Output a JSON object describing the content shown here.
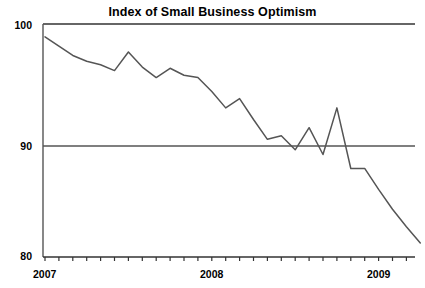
{
  "chart_data": {
    "type": "line",
    "title": "Index of Small Business Optimism",
    "xlabel": "",
    "ylabel": "",
    "ylim": [
      80,
      100
    ],
    "xlim": [
      "2007-01",
      "2009-04"
    ],
    "grid": false,
    "legend": "none",
    "y_ticks": [
      "100",
      "90",
      "80"
    ],
    "y_tick_values": [
      100,
      90,
      80
    ],
    "x_ticks": [
      "2007",
      "2008",
      "2009"
    ],
    "x_tick_values": [
      "2007-01",
      "2008-01",
      "2009-01"
    ],
    "minor_x_ticks": "monthly",
    "reference_lines": [
      {
        "axis": "y",
        "value": 90,
        "label": "90"
      },
      {
        "axis": "y",
        "value": 100,
        "label": "100"
      }
    ],
    "line_color": "#555555",
    "axis_color": "#333333",
    "x": [
      "2007-01",
      "2007-02",
      "2007-03",
      "2007-04",
      "2007-05",
      "2007-06",
      "2007-07",
      "2007-08",
      "2007-09",
      "2007-10",
      "2007-11",
      "2007-12",
      "2008-01",
      "2008-02",
      "2008-03",
      "2008-04",
      "2008-05",
      "2008-06",
      "2008-07",
      "2008-08",
      "2008-09",
      "2008-10",
      "2008-11",
      "2008-12",
      "2009-01",
      "2009-02",
      "2009-03",
      "2009-04"
    ],
    "categories": [
      "Jan 2007",
      "Feb 2007",
      "Mar 2007",
      "Apr 2007",
      "May 2007",
      "Jun 2007",
      "Jul 2007",
      "Aug 2007",
      "Sep 2007",
      "Oct 2007",
      "Nov 2007",
      "Dec 2007",
      "Jan 2008",
      "Feb 2008",
      "Mar 2008",
      "Apr 2008",
      "May 2008",
      "Jun 2008",
      "Jul 2008",
      "Aug 2008",
      "Sep 2008",
      "Oct 2008",
      "Nov 2008",
      "Dec 2008",
      "Jan 2009",
      "Feb 2009",
      "Mar 2009",
      "Apr 2009"
    ],
    "values": [
      98.9,
      98.1,
      97.3,
      96.8,
      96.5,
      96.0,
      97.6,
      96.3,
      95.4,
      96.2,
      95.6,
      95.4,
      94.2,
      92.8,
      93.6,
      91.8,
      90.1,
      90.4,
      89.2,
      91.1,
      88.8,
      92.8,
      87.6,
      87.6,
      85.8,
      84.1,
      82.6,
      81.2
    ]
  }
}
